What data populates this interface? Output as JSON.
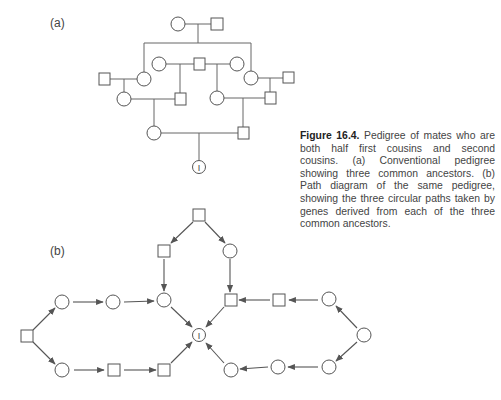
{
  "figure": {
    "number": "Figure 16.4.",
    "caption": "Pedigree of mates who are both half first cousins and second cousins. (a) Conventional pedigree showing three common ancestors. (b) Path diagram of the same pedigree, showing the three circular paths taken by genes derived from each of the three common ancestors."
  },
  "panels": {
    "a": {
      "label": "(a)",
      "title": "Conventional pedigree"
    },
    "b": {
      "label": "(b)",
      "title": "Path diagram"
    }
  },
  "inbred_symbol": "I",
  "colors": {
    "stroke": "#555555",
    "text": "#444444"
  },
  "pedigree_a": {
    "nodes": [
      {
        "id": "g1f",
        "shape": "circle",
        "x": 178,
        "y": 24
      },
      {
        "id": "g1m",
        "shape": "square",
        "x": 217,
        "y": 24
      },
      {
        "id": "g2a",
        "shape": "circle",
        "x": 159,
        "y": 64
      },
      {
        "id": "g2b",
        "shape": "square",
        "x": 199,
        "y": 64
      },
      {
        "id": "g2c",
        "shape": "circle",
        "x": 237,
        "y": 64
      },
      {
        "id": "s1",
        "shape": "square",
        "x": 105,
        "y": 79
      },
      {
        "id": "d1",
        "shape": "circle",
        "x": 144,
        "y": 79
      },
      {
        "id": "d2",
        "shape": "circle",
        "x": 251,
        "y": 78
      },
      {
        "id": "s2",
        "shape": "square",
        "x": 288,
        "y": 78
      },
      {
        "id": "r3a",
        "shape": "circle",
        "x": 124,
        "y": 99
      },
      {
        "id": "r3b",
        "shape": "square",
        "x": 180,
        "y": 99
      },
      {
        "id": "r3c",
        "shape": "circle",
        "x": 217,
        "y": 98
      },
      {
        "id": "r3d",
        "shape": "square",
        "x": 270,
        "y": 98
      },
      {
        "id": "r4a",
        "shape": "circle",
        "x": 154,
        "y": 133
      },
      {
        "id": "r4b",
        "shape": "square",
        "x": 243,
        "y": 133
      },
      {
        "id": "I",
        "shape": "circle-I",
        "x": 199,
        "y": 167
      }
    ]
  },
  "path_b": {
    "nodes": [
      {
        "id": "top",
        "shape": "square",
        "x": 199,
        "y": 215
      },
      {
        "id": "tl",
        "shape": "square",
        "x": 164,
        "y": 251
      },
      {
        "id": "tr",
        "shape": "circle",
        "x": 230,
        "y": 251
      },
      {
        "id": "L",
        "shape": "square",
        "x": 27,
        "y": 336
      },
      {
        "id": "u1",
        "shape": "circle",
        "x": 62,
        "y": 302
      },
      {
        "id": "u2",
        "shape": "circle",
        "x": 113,
        "y": 302
      },
      {
        "id": "u3",
        "shape": "circle",
        "x": 164,
        "y": 300
      },
      {
        "id": "l1",
        "shape": "circle",
        "x": 62,
        "y": 370
      },
      {
        "id": "l2",
        "shape": "square",
        "x": 114,
        "y": 370
      },
      {
        "id": "l3",
        "shape": "square",
        "x": 164,
        "y": 370
      },
      {
        "id": "I",
        "shape": "circle-I",
        "x": 199,
        "y": 335
      },
      {
        "id": "ru3",
        "shape": "square",
        "x": 231,
        "y": 300
      },
      {
        "id": "ru2",
        "shape": "square",
        "x": 279,
        "y": 300
      },
      {
        "id": "ru1",
        "shape": "circle",
        "x": 329,
        "y": 299
      },
      {
        "id": "R",
        "shape": "circle",
        "x": 364,
        "y": 335
      },
      {
        "id": "rl1",
        "shape": "circle",
        "x": 329,
        "y": 367
      },
      {
        "id": "rl2",
        "shape": "circle",
        "x": 278,
        "y": 367
      },
      {
        "id": "rl3",
        "shape": "circle",
        "x": 231,
        "y": 370
      }
    ],
    "edges": [
      [
        "top",
        "tl"
      ],
      [
        "top",
        "tr"
      ],
      [
        "tl",
        "u3"
      ],
      [
        "tr",
        "ru3"
      ],
      [
        "L",
        "u1"
      ],
      [
        "u1",
        "u2"
      ],
      [
        "u2",
        "u3"
      ],
      [
        "u3",
        "I"
      ],
      [
        "L",
        "l1"
      ],
      [
        "l1",
        "l2"
      ],
      [
        "l2",
        "l3"
      ],
      [
        "l3",
        "I"
      ],
      [
        "R",
        "ru1"
      ],
      [
        "ru1",
        "ru2"
      ],
      [
        "ru2",
        "ru3"
      ],
      [
        "ru3",
        "I"
      ],
      [
        "R",
        "rl1"
      ],
      [
        "rl1",
        "rl2"
      ],
      [
        "rl2",
        "rl3"
      ],
      [
        "rl3",
        "I"
      ]
    ]
  }
}
